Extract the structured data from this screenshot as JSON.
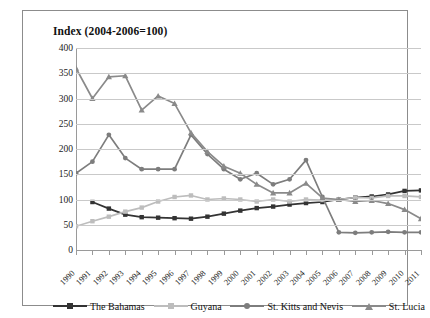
{
  "chart_data": {
    "type": "line",
    "title": "Index (2004-2006=100)",
    "xlabel": "",
    "ylabel": "",
    "ylim": [
      0,
      400
    ],
    "ytick_step": 50,
    "yticks": [
      400,
      350,
      300,
      250,
      200,
      150,
      100,
      50,
      0
    ],
    "grid": true,
    "legend_position": "bottom",
    "categories": [
      "1990",
      "1991",
      "1992",
      "1993",
      "1994",
      "1995",
      "1996",
      "1997",
      "1998",
      "1999",
      "2000",
      "2001",
      "2002",
      "2003",
      "2004",
      "2005",
      "2006",
      "2007",
      "2008",
      "2009",
      "2010",
      "2011"
    ],
    "series": [
      {
        "name": "The Bahamas",
        "color": "#333333",
        "marker": "square",
        "values": [
          null,
          95,
          82,
          70,
          65,
          64,
          63,
          62,
          66,
          72,
          78,
          83,
          86,
          90,
          93,
          95,
          100,
          104,
          106,
          110,
          117,
          118
        ]
      },
      {
        "name": "Guyana",
        "color": "#bdbdbd",
        "marker": "square",
        "values": [
          47,
          57,
          66,
          76,
          84,
          96,
          105,
          108,
          100,
          102,
          100,
          96,
          100,
          96,
          100,
          99,
          100,
          104,
          103,
          107,
          107,
          105
        ]
      },
      {
        "name": "St. Kitts and Nevis",
        "color": "#7d7d7d",
        "marker": "circle",
        "values": [
          152,
          175,
          228,
          182,
          160,
          160,
          160,
          228,
          190,
          160,
          140,
          152,
          130,
          140,
          178,
          105,
          35,
          34,
          35,
          36,
          35,
          35
        ]
      },
      {
        "name": "St. Lucia",
        "color": "#8a8a8a",
        "marker": "triangle",
        "values": [
          360,
          300,
          343,
          345,
          277,
          305,
          290,
          232,
          195,
          166,
          152,
          130,
          113,
          113,
          132,
          103,
          100,
          96,
          98,
          92,
          80,
          62
        ]
      }
    ]
  },
  "legend": {
    "items": [
      {
        "label": "The Bahamas"
      },
      {
        "label": "Guyana"
      },
      {
        "label": "St. Kitts and Nevis"
      },
      {
        "label": "St. Lucia"
      }
    ]
  }
}
